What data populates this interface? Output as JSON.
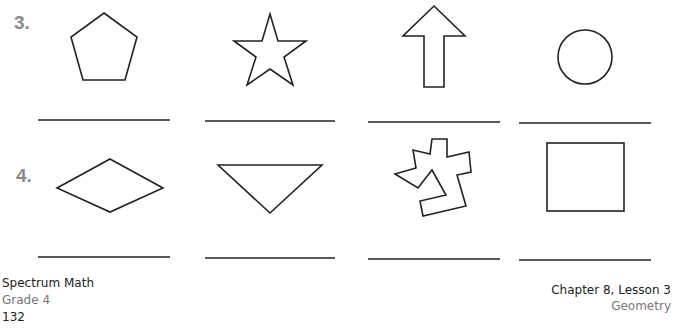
{
  "problems": [
    {
      "number": "3.",
      "shapes": [
        "pentagon",
        "star",
        "arrow",
        "circle"
      ]
    },
    {
      "number": "4.",
      "shapes": [
        "rhombus",
        "triangle",
        "irregular-polygon",
        "square"
      ]
    }
  ],
  "footer": {
    "book": "Spectrum Math",
    "grade": "Grade 4",
    "page": "132",
    "chapter": "Chapter 8, Lesson 3",
    "subject": "Geometry"
  },
  "colors": {
    "stroke": "#222222",
    "number": "#8a8a8a"
  }
}
